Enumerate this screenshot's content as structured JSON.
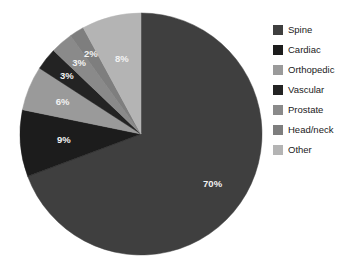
{
  "chart_data": {
    "type": "pie",
    "title": "",
    "subtitle": "",
    "xlabel": "",
    "ylabel": "",
    "legend_position": "right",
    "grid": false,
    "start_angle_deg": 0,
    "direction": "clockwise",
    "categories": [
      "Spine",
      "Cardiac",
      "Orthopedic",
      "Vascular",
      "Prostate",
      "Head/neck",
      "Other"
    ],
    "values": [
      70,
      9,
      6,
      3,
      3,
      2,
      8
    ],
    "value_labels": [
      "70%",
      "9%",
      "6%",
      "3%",
      "3%",
      "2%",
      "8%"
    ],
    "colors": [
      "#3f3f3f",
      "#1c1c1c",
      "#9a9a9a",
      "#232323",
      "#8a8a8a",
      "#7e7e7e",
      "#b4b4b4"
    ],
    "slices": [
      {
        "name": "Spine",
        "value": 70,
        "label": "70%",
        "color": "#3f3f3f",
        "label_color": "#f2f2f2"
      },
      {
        "name": "Cardiac",
        "value": 9,
        "label": "9%",
        "color": "#1c1c1c",
        "label_color": "#f2f2f2"
      },
      {
        "name": "Orthopedic",
        "value": 6,
        "label": "6%",
        "color": "#9a9a9a",
        "label_color": "#f5f5f5"
      },
      {
        "name": "Vascular",
        "value": 3,
        "label": "3%",
        "color": "#232323",
        "label_color": "#f2f2f2"
      },
      {
        "name": "Prostate",
        "value": 3,
        "label": "3%",
        "color": "#8a8a8a",
        "label_color": "#f5f5f5"
      },
      {
        "name": "Head/neck",
        "value": 2,
        "label": "2%",
        "color": "#7e7e7e",
        "label_color": "#f5f5f5"
      },
      {
        "name": "Other",
        "value": 8,
        "label": "8%",
        "color": "#b4b4b4",
        "label_color": "#f7f7f7"
      }
    ]
  },
  "legend": {
    "items": [
      {
        "label": "Spine",
        "color": "#3f3f3f"
      },
      {
        "label": "Cardiac",
        "color": "#1c1c1c"
      },
      {
        "label": "Orthopedic",
        "color": "#9a9a9a"
      },
      {
        "label": "Vascular",
        "color": "#232323"
      },
      {
        "label": "Prostate",
        "color": "#8a8a8a"
      },
      {
        "label": "Head/neck",
        "color": "#7e7e7e"
      },
      {
        "label": "Other",
        "color": "#b4b4b4"
      }
    ]
  },
  "caption": {
    "text": ""
  }
}
